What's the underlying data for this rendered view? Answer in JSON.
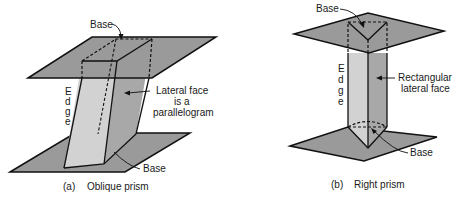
{
  "figure_a": {
    "caption_letter": "(a)",
    "caption_text": "Oblique prism",
    "labels": {
      "base_top": "Base",
      "base_bottom": "Base",
      "edge_letters": [
        "E",
        "d",
        "g",
        "e"
      ],
      "lateral_line1": "Lateral face",
      "lateral_line2": "is a",
      "lateral_line3": "parallelogram"
    }
  },
  "figure_b": {
    "caption_letter": "(b)",
    "caption_text": "Right prism",
    "labels": {
      "base_top": "Base",
      "base_bottom": "Base",
      "edge_letters": [
        "E",
        "d",
        "g",
        "e"
      ],
      "lateral_line1": "Rectangular",
      "lateral_line2": "lateral face"
    }
  },
  "colors": {
    "plane_fill": "#9a9a9a",
    "face_light": "#d2d2d2",
    "face_dark": "#a8a8a8",
    "stroke": "#111111"
  }
}
